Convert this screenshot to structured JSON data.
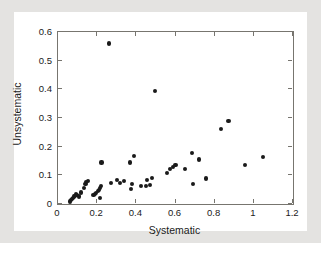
{
  "chart_data": {
    "type": "scatter",
    "title": "",
    "xlabel": "Systematic",
    "ylabel": "Unsystematic",
    "xlim": [
      0,
      1.2
    ],
    "ylim": [
      0,
      0.6
    ],
    "xticks": [
      "0",
      "0.2",
      "0.4",
      "0.6",
      "0.8",
      "1",
      "1.2"
    ],
    "xtick_values": [
      0,
      0.2,
      0.4,
      0.6,
      0.8,
      1.0,
      1.2
    ],
    "yticks": [
      "0",
      "0.1",
      "0.2",
      "0.3",
      "0.4",
      "0.5",
      "0.6"
    ],
    "ytick_values": [
      0,
      0.1,
      0.2,
      0.3,
      0.4,
      0.5,
      0.6
    ],
    "grid": false,
    "legend": null,
    "marker": "filled-circle",
    "marker_color": "#1a1a1a",
    "points": [
      {
        "x": 0.062,
        "y": 0.009
      },
      {
        "x": 0.068,
        "y": 0.013
      },
      {
        "x": 0.072,
        "y": 0.017
      },
      {
        "x": 0.078,
        "y": 0.021
      },
      {
        "x": 0.082,
        "y": 0.026
      },
      {
        "x": 0.088,
        "y": 0.029
      },
      {
        "x": 0.092,
        "y": 0.033
      },
      {
        "x": 0.099,
        "y": 0.03
      },
      {
        "x": 0.106,
        "y": 0.026
      },
      {
        "x": 0.118,
        "y": 0.04
      },
      {
        "x": 0.133,
        "y": 0.055
      },
      {
        "x": 0.14,
        "y": 0.069
      },
      {
        "x": 0.145,
        "y": 0.077
      },
      {
        "x": 0.152,
        "y": 0.081
      },
      {
        "x": 0.181,
        "y": 0.031
      },
      {
        "x": 0.188,
        "y": 0.035
      },
      {
        "x": 0.196,
        "y": 0.038
      },
      {
        "x": 0.203,
        "y": 0.045
      },
      {
        "x": 0.209,
        "y": 0.05
      },
      {
        "x": 0.213,
        "y": 0.056
      },
      {
        "x": 0.218,
        "y": 0.062
      },
      {
        "x": 0.215,
        "y": 0.022
      },
      {
        "x": 0.222,
        "y": 0.145
      },
      {
        "x": 0.262,
        "y": 0.56
      },
      {
        "x": 0.272,
        "y": 0.074
      },
      {
        "x": 0.3,
        "y": 0.083
      },
      {
        "x": 0.318,
        "y": 0.074
      },
      {
        "x": 0.338,
        "y": 0.079
      },
      {
        "x": 0.368,
        "y": 0.145
      },
      {
        "x": 0.372,
        "y": 0.052
      },
      {
        "x": 0.378,
        "y": 0.07
      },
      {
        "x": 0.388,
        "y": 0.167
      },
      {
        "x": 0.424,
        "y": 0.063
      },
      {
        "x": 0.448,
        "y": 0.064
      },
      {
        "x": 0.455,
        "y": 0.083
      },
      {
        "x": 0.47,
        "y": 0.067
      },
      {
        "x": 0.482,
        "y": 0.09
      },
      {
        "x": 0.497,
        "y": 0.395
      },
      {
        "x": 0.556,
        "y": 0.108
      },
      {
        "x": 0.57,
        "y": 0.122
      },
      {
        "x": 0.588,
        "y": 0.13
      },
      {
        "x": 0.6,
        "y": 0.136
      },
      {
        "x": 0.648,
        "y": 0.122
      },
      {
        "x": 0.684,
        "y": 0.177
      },
      {
        "x": 0.688,
        "y": 0.07
      },
      {
        "x": 0.722,
        "y": 0.155
      },
      {
        "x": 0.757,
        "y": 0.089
      },
      {
        "x": 0.833,
        "y": 0.263
      },
      {
        "x": 0.871,
        "y": 0.289
      },
      {
        "x": 0.954,
        "y": 0.137
      },
      {
        "x": 1.047,
        "y": 0.165
      }
    ]
  }
}
